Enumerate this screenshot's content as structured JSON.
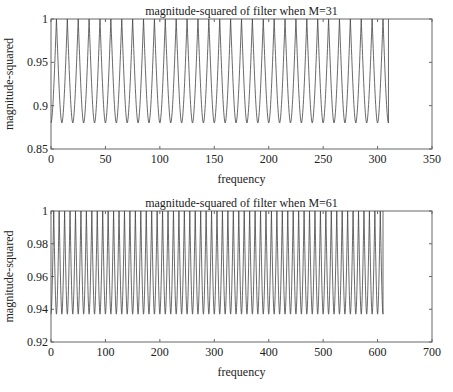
{
  "chart_data": [
    {
      "type": "line",
      "title": "magnitude-squared of filter when M=31",
      "xlabel": "frequency",
      "ylabel": "magnitude-squared",
      "xlim": [
        0,
        350
      ],
      "ylim": [
        0.85,
        1
      ],
      "xticks": [
        0,
        50,
        100,
        150,
        200,
        250,
        300,
        350
      ],
      "yticks": [
        0.85,
        0.9,
        0.95,
        1
      ],
      "ytick_labels": [
        "0.85",
        "0.9",
        "0.95",
        "1"
      ],
      "grid": false,
      "series": [
        {
          "name": "M=31",
          "x_start": 0,
          "x_end": 310,
          "period": 10,
          "peak": 1.0,
          "trough": 0.88,
          "num_peaks": 31,
          "start_value": 0.88
        }
      ]
    },
    {
      "type": "line",
      "title": "magnitude-squared of filter when M=61",
      "xlabel": "frequency",
      "ylabel": "magnitude-squared",
      "xlim": [
        0,
        700
      ],
      "ylim": [
        0.92,
        1
      ],
      "xticks": [
        0,
        100,
        200,
        300,
        400,
        500,
        600,
        700
      ],
      "yticks": [
        0.92,
        0.94,
        0.96,
        0.98,
        1
      ],
      "ytick_labels": [
        "0.92",
        "0.94",
        "0.96",
        "0.98",
        "1"
      ],
      "grid": false,
      "series": [
        {
          "name": "M=61",
          "x_start": 0,
          "x_end": 610,
          "period": 10,
          "peak": 1.0,
          "trough": 0.937,
          "num_peaks": 61,
          "start_value": 0.937
        }
      ]
    }
  ]
}
